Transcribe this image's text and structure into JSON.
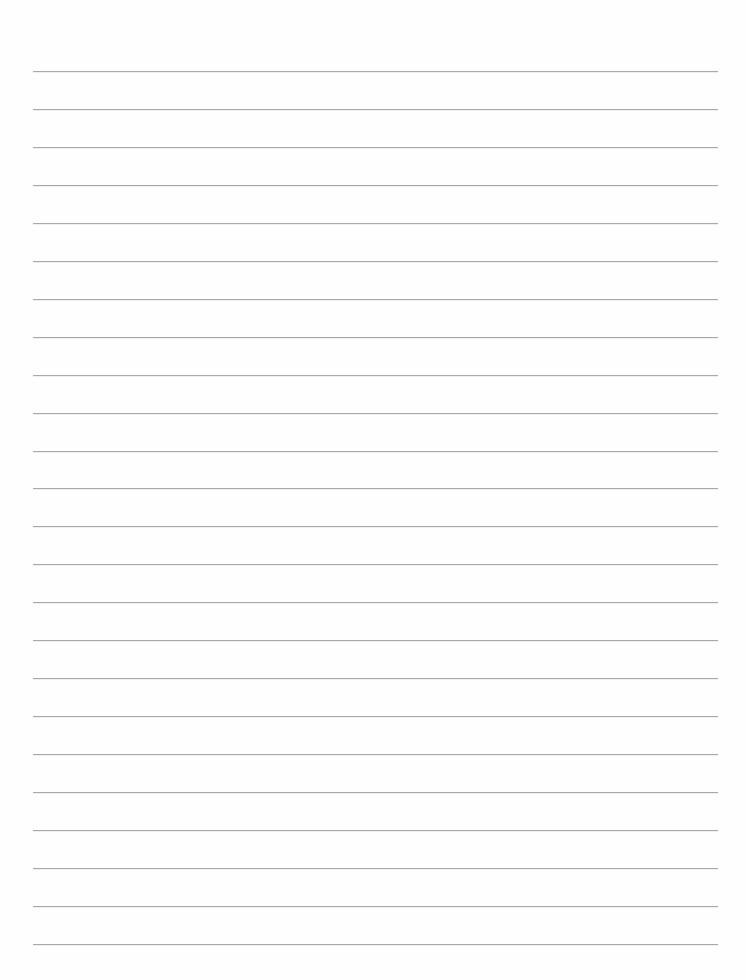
{
  "page": {
    "type": "blank lined paper",
    "background_color": "#fefefe",
    "text": ""
  },
  "rules": {
    "count": 24,
    "color": "#a9a9a9",
    "first_y": 71,
    "spacing": 37.95,
    "left": 33,
    "right": 718,
    "thickness": 1
  }
}
